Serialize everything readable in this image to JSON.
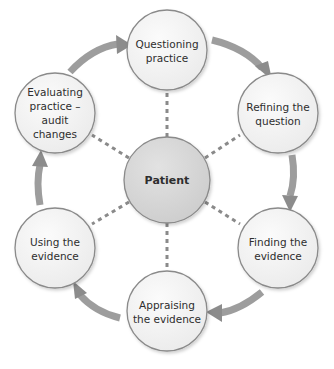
{
  "diagram": {
    "type": "cycle",
    "center": {
      "label": "Patient",
      "fill": "#d6d6d6"
    },
    "nodes": [
      {
        "id": "questioning",
        "lines": [
          "Questioning",
          "practice"
        ]
      },
      {
        "id": "refining",
        "lines": [
          "Refining the",
          "question"
        ]
      },
      {
        "id": "finding",
        "lines": [
          "Finding the",
          "evidence"
        ]
      },
      {
        "id": "appraising",
        "lines": [
          "Appraising",
          "the evidence"
        ]
      },
      {
        "id": "using",
        "lines": [
          "Using the",
          "evidence"
        ]
      },
      {
        "id": "evaluating",
        "lines": [
          "Evaluating",
          "practice –",
          "audit",
          "changes"
        ]
      }
    ],
    "colors": {
      "node_fill": "#f2f2f2",
      "node_stroke": "#8a8a8a",
      "arrow": "#8c8c8c",
      "connector": "#8a8a8a"
    }
  }
}
